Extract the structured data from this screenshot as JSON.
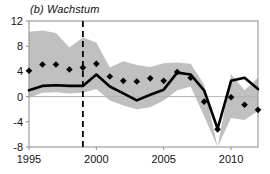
{
  "chart_data": {
    "type": "line",
    "title": "(b) Wachstum",
    "xlabel": "",
    "ylabel": "",
    "xlim": [
      1995,
      2012
    ],
    "ylim": [
      -8,
      12
    ],
    "grid": false,
    "legend": "none",
    "y_ticks": [
      12,
      8,
      4,
      0,
      -4,
      -8
    ],
    "x_ticks": [
      1995,
      2000,
      2005,
      2010
    ],
    "x": [
      1995,
      1996,
      1997,
      1998,
      1999,
      2000,
      2001,
      2002,
      2003,
      2004,
      2005,
      2006,
      2007,
      2008,
      2009,
      2010,
      2011,
      2012
    ],
    "series": [
      {
        "name": "Bandbreite oben",
        "style": "band-upper",
        "color": "#c0c0c0",
        "values": [
          10.3,
          10.5,
          10.1,
          7.8,
          9.4,
          8.6,
          4.6,
          5.6,
          5.0,
          4.7,
          5.3,
          5.4,
          5.2,
          1.9,
          -8.0,
          3.6,
          1.0,
          3.0
        ]
      },
      {
        "name": "Bandbreite unten",
        "style": "band-lower",
        "color": "#c0c0c0",
        "values": [
          -0.2,
          0.6,
          0.7,
          0.5,
          0.6,
          1.2,
          -0.6,
          -1.4,
          -2.0,
          -1.7,
          -0.6,
          1.0,
          1.6,
          -3.1,
          -8.0,
          -3.4,
          -3.7,
          -2.3
        ]
      },
      {
        "name": "Median",
        "style": "thick-line",
        "color": "#000000",
        "values": [
          1.0,
          1.7,
          1.8,
          1.7,
          1.7,
          3.5,
          1.6,
          0.5,
          -0.6,
          0.3,
          1.1,
          3.8,
          3.5,
          1.0,
          -5.1,
          2.5,
          3.0,
          1.2
        ]
      },
      {
        "name": "Punktprognose",
        "style": "diamond-markers",
        "color": "#000000",
        "values": [
          4.1,
          5.1,
          5.1,
          4.3,
          4.6,
          5.2,
          3.2,
          2.5,
          2.4,
          2.9,
          2.5,
          3.9,
          3.0,
          -0.8,
          -5.2,
          -0.1,
          -1.3,
          -2.1
        ]
      }
    ],
    "annotations": [
      {
        "type": "vertical-dashed-line",
        "name": "prognose-trennlinie",
        "x": 1999,
        "color": "#000000"
      },
      {
        "type": "horizontal-zero-line",
        "name": "nulllinie",
        "y": 0,
        "color": "#b3b3b3"
      }
    ]
  }
}
